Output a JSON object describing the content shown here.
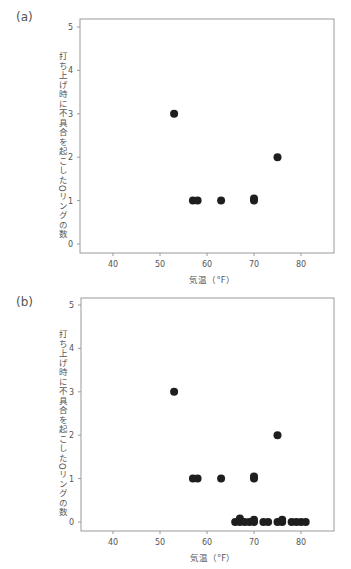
{
  "chart_data": [
    {
      "panel": "(a)",
      "type": "scatter",
      "title": "",
      "xlabel": "気温（°F）",
      "ylabel": "打ち上げ時に不具合を起こしたOリングの数",
      "xlim": [
        33,
        87
      ],
      "ylim": [
        -0.2,
        5.2
      ],
      "xticks": [
        40,
        50,
        60,
        70,
        80
      ],
      "yticks": [
        0,
        1,
        2,
        3,
        4,
        5
      ],
      "grid": false,
      "legend": null,
      "points": [
        {
          "x": 53,
          "y": 3
        },
        {
          "x": 57,
          "y": 1
        },
        {
          "x": 58,
          "y": 1
        },
        {
          "x": 63,
          "y": 1
        },
        {
          "x": 70,
          "y": 1
        },
        {
          "x": 70,
          "y": 1.05
        },
        {
          "x": 75,
          "y": 2
        }
      ]
    },
    {
      "panel": "(b)",
      "type": "scatter",
      "title": "",
      "xlabel": "気温（°F）",
      "ylabel": "打ち上げ時に不具合を起こしたOリングの数",
      "xlim": [
        33,
        87
      ],
      "ylim": [
        -0.2,
        5.2
      ],
      "xticks": [
        40,
        50,
        60,
        70,
        80
      ],
      "yticks": [
        0,
        1,
        2,
        3,
        4,
        5
      ],
      "grid": false,
      "legend": null,
      "points": [
        {
          "x": 53,
          "y": 3
        },
        {
          "x": 57,
          "y": 1
        },
        {
          "x": 58,
          "y": 1
        },
        {
          "x": 63,
          "y": 1
        },
        {
          "x": 70,
          "y": 1
        },
        {
          "x": 70,
          "y": 1.05
        },
        {
          "x": 75,
          "y": 2
        },
        {
          "x": 66,
          "y": 0
        },
        {
          "x": 67,
          "y": 0
        },
        {
          "x": 67,
          "y": 0.08
        },
        {
          "x": 68,
          "y": 0
        },
        {
          "x": 69,
          "y": 0
        },
        {
          "x": 70,
          "y": 0
        },
        {
          "x": 70,
          "y": 0.05
        },
        {
          "x": 72,
          "y": 0
        },
        {
          "x": 73,
          "y": 0
        },
        {
          "x": 75,
          "y": 0
        },
        {
          "x": 76,
          "y": 0
        },
        {
          "x": 76,
          "y": 0.05
        },
        {
          "x": 78,
          "y": 0
        },
        {
          "x": 79,
          "y": 0
        },
        {
          "x": 80,
          "y": 0
        },
        {
          "x": 81,
          "y": 0
        }
      ]
    }
  ],
  "panels": {
    "a": {
      "label": "(a)"
    },
    "b": {
      "label": "(b)"
    }
  },
  "axis": {
    "xlabel": "気温（°F）",
    "ylabel": "打ち上げ時に不具合を起こしたOリングの数"
  },
  "colors": {
    "marker": "#1e1e1e",
    "frame": "#9a9a9a",
    "text": "#555555"
  }
}
